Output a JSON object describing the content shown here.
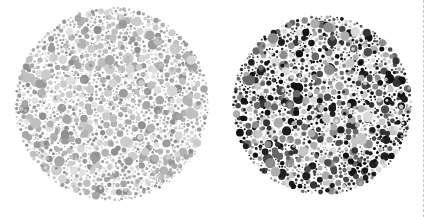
{
  "figure": {
    "width": 428,
    "height": 217,
    "background_color": "#ffffff"
  },
  "chart_data": {
    "type": "scatter",
    "subtitle": "",
    "xlabel": "",
    "ylabel": "",
    "grid": false,
    "legend": "none",
    "xlim": [
      0,
      428
    ],
    "ylim": [
      0,
      217
    ],
    "series": [
      {
        "name": "left-plate-low-contrast",
        "shape": "circle",
        "center_x": 112,
        "center_y": 104,
        "radius": 97,
        "dot_count": 900,
        "dot_radius_range": [
          1.4,
          5.6
        ],
        "contrast": "low",
        "palette": [
          "#8f8f8f",
          "#9b9b9b",
          "#a7a7a7",
          "#b3b3b3",
          "#bfbfbf",
          "#cbcbcb",
          "#d6d6d6",
          "#e0e0e0"
        ],
        "palette_weights": [
          0.1,
          0.12,
          0.13,
          0.14,
          0.15,
          0.14,
          0.12,
          0.1
        ],
        "seed": 1337
      },
      {
        "name": "right-plate-high-contrast",
        "shape": "circle",
        "center_x": 322,
        "center_y": 105,
        "radius": 90,
        "dot_count": 820,
        "dot_radius_range": [
          1.4,
          5.4
        ],
        "contrast": "high",
        "palette": [
          "#121212",
          "#1f1f1f",
          "#343434",
          "#4a4a4a",
          "#676767",
          "#8c8c8c",
          "#adadad",
          "#c6c6c6",
          "#dadada"
        ],
        "palette_weights": [
          0.13,
          0.11,
          0.1,
          0.1,
          0.11,
          0.12,
          0.12,
          0.11,
          0.1
        ],
        "seed": 9001
      }
    ],
    "annotations": [
      {
        "name": "divider",
        "type": "vertical-dashed-line",
        "x": 423,
        "color": "#c8c8c8",
        "width": 1,
        "dash": "2 3"
      }
    ]
  }
}
